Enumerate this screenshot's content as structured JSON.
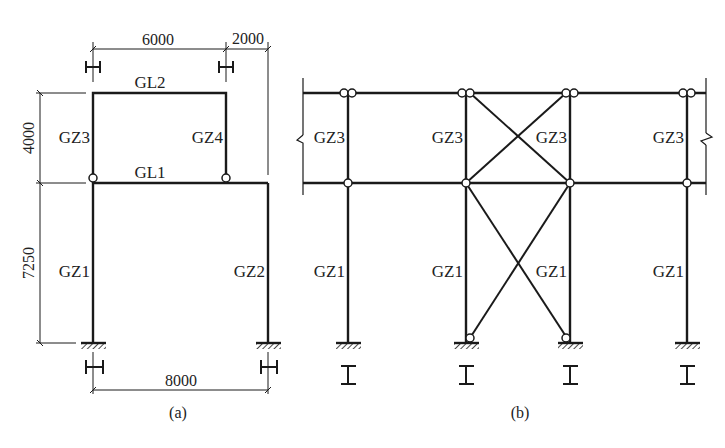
{
  "diagram_a": {
    "caption": "(a)",
    "dimensions": {
      "top_span": "6000",
      "cantilever": "2000",
      "upper_height": "4000",
      "lower_height": "7250",
      "bottom_span": "8000"
    },
    "beams": {
      "top": "GL2",
      "middle": "GL1"
    },
    "columns": {
      "upper_left": "GZ3",
      "upper_right": "GZ4",
      "lower_left": "GZ1",
      "lower_right": "GZ2"
    }
  },
  "diagram_b": {
    "caption": "(b)",
    "upper_columns": [
      "GZ3",
      "GZ3",
      "GZ3",
      "GZ3"
    ],
    "lower_columns": [
      "GZ1",
      "GZ1",
      "GZ1",
      "GZ1"
    ]
  },
  "colors": {
    "line": "#1a1a1a",
    "background": "#ffffff"
  }
}
